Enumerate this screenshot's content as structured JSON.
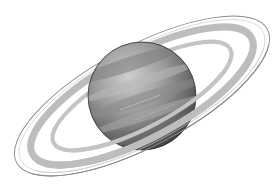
{
  "image": {
    "subject": "Ringed planet illustration (Saturn-like) in grayscale",
    "background": "#ffffff",
    "top_text_fragment": "",
    "planet": {
      "center": [
        142,
        96
      ],
      "radius": 54,
      "colors": {
        "highlight": "#c8c8c8",
        "mid": "#8f8f8f",
        "shadow": "#3e3e3e",
        "band": "#a8a8a8"
      }
    },
    "rings": {
      "center": [
        142,
        96
      ],
      "rotation_deg": -28,
      "outer_line": {
        "rx": 142,
        "ry": 50,
        "color": "#8a8a8a"
      },
      "wide_band": {
        "rx": 124,
        "ry": 42,
        "color": "#bdbdbd",
        "width": 7
      },
      "inner_band": {
        "rx": 100,
        "ry": 31,
        "color": "#c4c4c4",
        "width": 4
      }
    }
  }
}
